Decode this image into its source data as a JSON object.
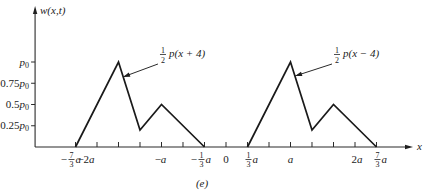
{
  "chart_data": {
    "type": "line",
    "title": "",
    "caption": "(e)",
    "xlabel": "x",
    "ylabel": "w(x,t)",
    "x_unit": "a",
    "y_unit": "p0",
    "xlim": [
      -2.96,
      2.9
    ],
    "ylim": [
      0,
      1.66
    ],
    "grid": false,
    "legend": "none",
    "x_ticks": [
      -2.3333,
      -2.0,
      -1.6667,
      -1.3333,
      -1.0,
      -0.6667,
      -0.3333,
      0.0,
      0.3333,
      0.6667,
      1.0,
      1.3333,
      1.6667,
      2.0,
      2.3333
    ],
    "x_tick_labels": [
      {
        "value": -2.3333,
        "coef": "−",
        "num": "7",
        "den": "3",
        "var": "a"
      },
      {
        "value": -2.0,
        "coef": "−2",
        "var": "a"
      },
      {
        "value": -1.0,
        "coef": "−",
        "var": "a"
      },
      {
        "value": -0.3333,
        "coef": "−",
        "num": "1",
        "den": "3",
        "var": "a"
      },
      {
        "value": 0.0,
        "coef": "0",
        "var": ""
      },
      {
        "value": 0.3333,
        "coef": "",
        "num": "1",
        "den": "3",
        "var": "a"
      },
      {
        "value": 1.0,
        "coef": "",
        "var": "a"
      },
      {
        "value": 2.0,
        "coef": "2",
        "var": "a"
      },
      {
        "value": 2.3333,
        "coef": "",
        "num": "7",
        "den": "3",
        "var": "a"
      }
    ],
    "y_ticks": [
      0.25,
      0.5,
      0.75,
      1.0
    ],
    "y_tick_labels": [
      {
        "value": 1.0,
        "coef": "",
        "var": "p",
        "sub": "0"
      },
      {
        "value": 0.75,
        "coef": "0.75",
        "var": "p",
        "sub": "0"
      },
      {
        "value": 0.5,
        "coef": "0.5",
        "var": "p",
        "sub": "0"
      },
      {
        "value": 0.25,
        "coef": "0.25",
        "var": "p",
        "sub": "0"
      }
    ],
    "series": [
      {
        "name": "1/2 p(x + 4)",
        "x": [
          -2.3333,
          -1.6667,
          -1.3333,
          -1.0,
          -0.3333
        ],
        "y": [
          0,
          1.0,
          0.2,
          0.5,
          0
        ]
      },
      {
        "name": "1/2 p(x − 4)",
        "x": [
          0.3333,
          1.0,
          1.3333,
          1.6667,
          2.3333
        ],
        "y": [
          0,
          1.0,
          0.2,
          0.5,
          0
        ]
      }
    ],
    "annotations": [
      {
        "num": "1",
        "den": "2",
        "text": "p(x + 4)",
        "xy": [
          -1.597,
          0.824
        ],
        "xytext": [
          -0.977,
          1.059
        ]
      },
      {
        "num": "1",
        "den": "2",
        "text": "p(x − 4)",
        "xy": [
          1.07,
          0.835
        ],
        "xytext": [
          1.721,
          1.059
        ]
      }
    ]
  }
}
